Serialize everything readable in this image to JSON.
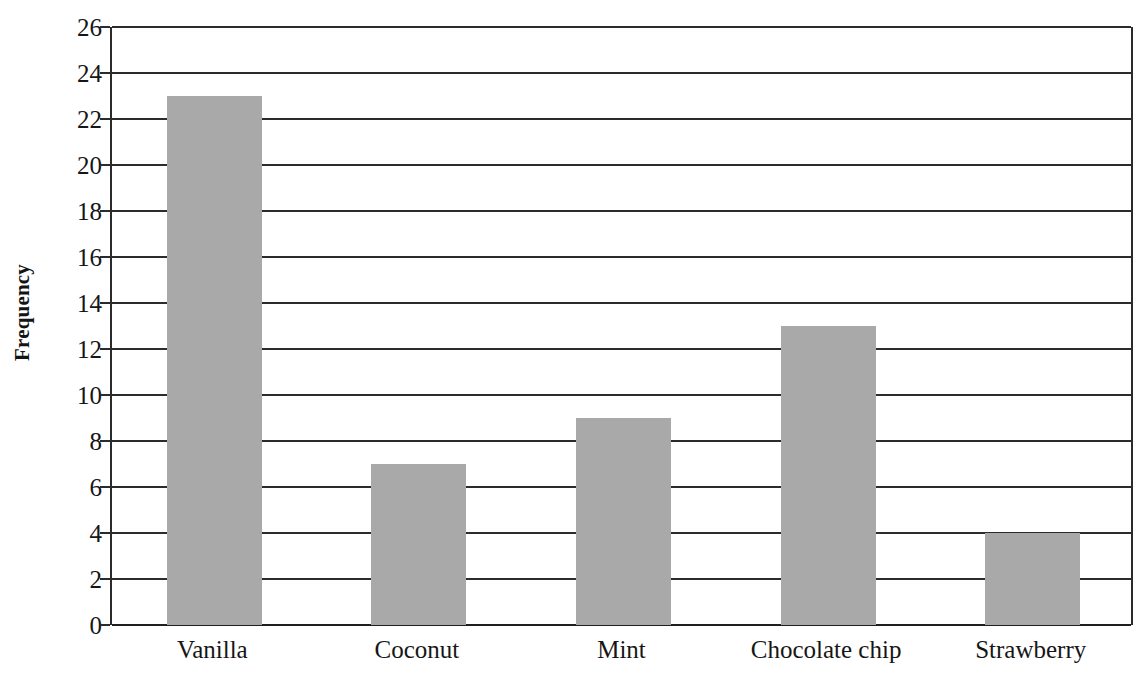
{
  "chart_data": {
    "type": "bar",
    "title": "",
    "subtitle": "",
    "xlabel": "",
    "ylabel": "Frequency",
    "categories": [
      "Vanilla",
      "Coconut",
      "Mint",
      "Chocolate chip",
      "Strawberry"
    ],
    "values": [
      23,
      7,
      9,
      13,
      4
    ],
    "ylim": [
      0,
      26
    ],
    "ytick_step": 2,
    "yticks": [
      0,
      2,
      4,
      6,
      8,
      10,
      12,
      14,
      16,
      18,
      20,
      22,
      24,
      26
    ],
    "ytick_labels": [
      "0",
      "2",
      "4",
      "6",
      "8",
      "10",
      "12",
      "14",
      "16",
      "18",
      "20",
      "22",
      "24",
      "26"
    ],
    "grid": true,
    "grid_axis": "y",
    "legend": false,
    "legend_position": "none",
    "bar_color": "#a9a9a9",
    "axis_color": "#2b2b2b",
    "background_color": "#ffffff",
    "series": [
      {
        "name": "Frequency",
        "values": [
          23,
          7,
          9,
          13,
          4
        ]
      }
    ]
  }
}
